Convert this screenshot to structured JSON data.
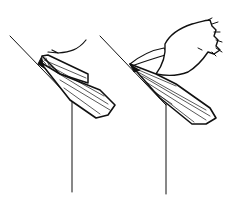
{
  "figure": {
    "background": "#ffffff",
    "stroke": "#111111",
    "panels": [
      {
        "id": "left",
        "label": ""
      },
      {
        "id": "right",
        "label": ""
      }
    ]
  }
}
